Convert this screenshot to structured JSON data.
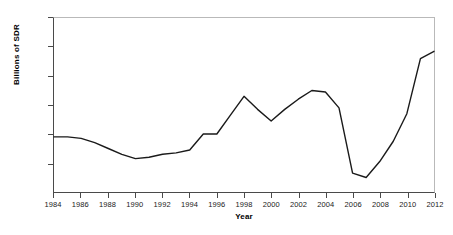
{
  "chart_data": {
    "type": "line",
    "title": "",
    "xlabel": "Year",
    "ylabel": "Billions of SDR",
    "xlim": [
      1984,
      2012
    ],
    "ylim": [
      0,
      120
    ],
    "grid": false,
    "legend": "none",
    "line_color": "#1a1a1a",
    "x_ticks": [
      1984,
      1986,
      1988,
      1990,
      1992,
      1994,
      1996,
      1998,
      2000,
      2002,
      2004,
      2006,
      2008,
      2010,
      2012
    ],
    "y_ticks": [
      20,
      40,
      60,
      80,
      100,
      120
    ],
    "x": [
      1984,
      1985,
      1986,
      1987,
      1988,
      1989,
      1990,
      1991,
      1992,
      1993,
      1994,
      1995,
      1996,
      1997,
      1998,
      1999,
      2000,
      2001,
      2002,
      2003,
      2004,
      2005,
      2006,
      2007,
      2008,
      2009,
      2010,
      2011,
      2012
    ],
    "values": [
      38,
      38,
      37,
      34,
      30,
      26,
      23,
      24,
      26,
      27,
      29,
      40,
      40,
      53,
      66,
      57,
      49,
      57,
      64,
      70,
      69,
      58,
      13,
      10,
      21,
      35,
      54,
      92,
      97
    ]
  }
}
